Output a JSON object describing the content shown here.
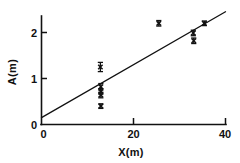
{
  "chart_data": {
    "type": "scatter",
    "title": "",
    "xlabel": "X(m)",
    "ylabel": "A(m)",
    "xlim": [
      0,
      40
    ],
    "ylim": [
      0,
      2.45
    ],
    "grid": false,
    "legend": null,
    "xticks": [
      0,
      20,
      40
    ],
    "xtick_labels": [
      "0",
      "20",
      "40"
    ],
    "yticks": [
      0,
      1,
      2
    ],
    "ytick_labels": [
      "0",
      "1",
      "2"
    ],
    "marker": "x",
    "error_bars": "vertical",
    "points": [
      {
        "x": 12.8,
        "y": 1.25,
        "yerr": 0.1
      },
      {
        "x": 12.9,
        "y": 0.82,
        "yerr": 0.07
      },
      {
        "x": 12.9,
        "y": 0.72,
        "yerr": 0.06
      },
      {
        "x": 12.9,
        "y": 0.64,
        "yerr": 0.06
      },
      {
        "x": 12.9,
        "y": 0.4,
        "yerr": 0.05
      },
      {
        "x": 25.5,
        "y": 2.2,
        "yerr": 0.06
      },
      {
        "x": 33.0,
        "y": 1.99,
        "yerr": 0.06
      },
      {
        "x": 33.1,
        "y": 1.82,
        "yerr": 0.06
      },
      {
        "x": 35.4,
        "y": 2.2,
        "yerr": 0.05
      }
    ],
    "fit_line": {
      "type": "line",
      "x": [
        0,
        40
      ],
      "y": [
        0.15,
        2.45
      ],
      "intercept": 0.15,
      "slope": 0.0575
    }
  }
}
